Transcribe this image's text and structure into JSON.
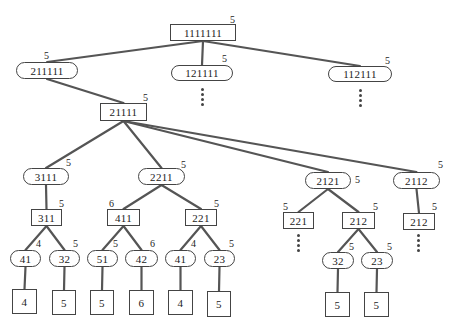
{
  "diagram": {
    "type": "tree",
    "edge_color": "#555555",
    "nodes": [
      {
        "id": "n0",
        "label": "1111111",
        "shape": "rect",
        "weight": "5",
        "x": 170,
        "y": 24,
        "w": 66,
        "h": 17,
        "wx": 230,
        "wy": 15
      },
      {
        "id": "n1",
        "label": "211111",
        "shape": "pill",
        "weight": "5",
        "x": 16,
        "y": 62,
        "w": 62,
        "h": 17,
        "wx": 44,
        "wy": 51
      },
      {
        "id": "n2",
        "label": "121111",
        "shape": "pill",
        "weight": "5",
        "x": 171,
        "y": 65,
        "w": 62,
        "h": 16,
        "wx": 222,
        "wy": 54
      },
      {
        "id": "n3",
        "label": "112111",
        "shape": "pill",
        "weight": "5",
        "x": 328,
        "y": 66,
        "w": 64,
        "h": 16,
        "wx": 385,
        "wy": 56
      },
      {
        "id": "n4",
        "label": "21111",
        "shape": "rect",
        "weight": "5",
        "x": 100,
        "y": 103,
        "w": 47,
        "h": 18,
        "wx": 143,
        "wy": 93
      },
      {
        "id": "n5",
        "label": "3111",
        "shape": "pill",
        "weight": "5",
        "x": 23,
        "y": 168,
        "w": 46,
        "h": 17,
        "wx": 66,
        "wy": 158
      },
      {
        "id": "n6",
        "label": "2211",
        "shape": "pill",
        "weight": "5",
        "x": 138,
        "y": 168,
        "w": 47,
        "h": 17,
        "wx": 181,
        "wy": 160
      },
      {
        "id": "n7",
        "label": "2121",
        "shape": "pill",
        "weight": "5",
        "x": 305,
        "y": 172,
        "w": 46,
        "h": 17,
        "wx": 355,
        "wy": 175
      },
      {
        "id": "n8",
        "label": "2112",
        "shape": "pill",
        "weight": "5",
        "x": 393,
        "y": 172,
        "w": 47,
        "h": 17,
        "wx": 438,
        "wy": 160
      },
      {
        "id": "n9",
        "label": "311",
        "shape": "rect",
        "weight": "5",
        "x": 31,
        "y": 209,
        "w": 31,
        "h": 17,
        "wx": 59,
        "wy": 199
      },
      {
        "id": "n10",
        "label": "411",
        "shape": "rect",
        "weight": "6",
        "x": 107,
        "y": 209,
        "w": 33,
        "h": 17,
        "wx": 109,
        "wy": 199
      },
      {
        "id": "n11",
        "label": "221",
        "shape": "rect",
        "weight": "5",
        "x": 185,
        "y": 209,
        "w": 32,
        "h": 17,
        "wx": 214,
        "wy": 199
      },
      {
        "id": "n12",
        "label": "221",
        "shape": "rect",
        "weight": "5",
        "x": 283,
        "y": 212,
        "w": 31,
        "h": 17,
        "wx": 283,
        "wy": 202
      },
      {
        "id": "n13",
        "label": "212",
        "shape": "rect",
        "weight": "5",
        "x": 342,
        "y": 212,
        "w": 33,
        "h": 17,
        "wx": 373,
        "wy": 202
      },
      {
        "id": "n14",
        "label": "212",
        "shape": "rect",
        "weight": "5",
        "x": 403,
        "y": 213,
        "w": 32,
        "h": 17,
        "wx": 432,
        "wy": 202
      },
      {
        "id": "n15",
        "label": "41",
        "shape": "pill",
        "weight": "4",
        "x": 10,
        "y": 250,
        "w": 31,
        "h": 17,
        "wx": 36,
        "wy": 239
      },
      {
        "id": "n16",
        "label": "32",
        "shape": "pill",
        "weight": "5",
        "x": 49,
        "y": 250,
        "w": 31,
        "h": 17,
        "wx": 73,
        "wy": 239
      },
      {
        "id": "n17",
        "label": "51",
        "shape": "pill",
        "weight": "5",
        "x": 87,
        "y": 250,
        "w": 31,
        "h": 17,
        "wx": 113,
        "wy": 239
      },
      {
        "id": "n18",
        "label": "42",
        "shape": "pill",
        "weight": "6",
        "x": 125,
        "y": 250,
        "w": 33,
        "h": 17,
        "wx": 150,
        "wy": 239
      },
      {
        "id": "n19",
        "label": "41",
        "shape": "pill",
        "weight": "4",
        "x": 165,
        "y": 250,
        "w": 31,
        "h": 17,
        "wx": 191,
        "wy": 239
      },
      {
        "id": "n20",
        "label": "23",
        "shape": "pill",
        "weight": "5",
        "x": 204,
        "y": 250,
        "w": 31,
        "h": 17,
        "wx": 229,
        "wy": 239
      },
      {
        "id": "n21",
        "label": "32",
        "shape": "pill",
        "weight": "5",
        "x": 322,
        "y": 252,
        "w": 32,
        "h": 17,
        "wx": 349,
        "wy": 242
      },
      {
        "id": "n22",
        "label": "23",
        "shape": "pill",
        "weight": "5",
        "x": 361,
        "y": 252,
        "w": 32,
        "h": 17,
        "wx": 387,
        "wy": 242
      },
      {
        "id": "n23",
        "label": "4",
        "shape": "leaf",
        "x": 12,
        "y": 289,
        "w": 25,
        "h": 25
      },
      {
        "id": "n24",
        "label": "5",
        "shape": "leaf",
        "x": 52,
        "y": 290,
        "w": 24,
        "h": 25
      },
      {
        "id": "n25",
        "label": "5",
        "shape": "leaf",
        "x": 90,
        "y": 290,
        "w": 24,
        "h": 25
      },
      {
        "id": "n26",
        "label": "6",
        "shape": "leaf",
        "x": 129,
        "y": 290,
        "w": 25,
        "h": 25
      },
      {
        "id": "n27",
        "label": "4",
        "shape": "leaf",
        "x": 168,
        "y": 290,
        "w": 25,
        "h": 25
      },
      {
        "id": "n28",
        "label": "5",
        "shape": "leaf",
        "x": 207,
        "y": 291,
        "w": 24,
        "h": 26
      },
      {
        "id": "n29",
        "label": "5",
        "shape": "leaf",
        "x": 325,
        "y": 292,
        "w": 25,
        "h": 25
      },
      {
        "id": "n30",
        "label": "5",
        "shape": "leaf",
        "x": 364,
        "y": 292,
        "w": 25,
        "h": 25
      }
    ],
    "edges": [
      [
        "n0",
        "n1"
      ],
      [
        "n0",
        "n2"
      ],
      [
        "n0",
        "n3"
      ],
      [
        "n1",
        "n4"
      ],
      [
        "n4",
        "n5"
      ],
      [
        "n4",
        "n6"
      ],
      [
        "n4",
        "n7"
      ],
      [
        "n4",
        "n8"
      ],
      [
        "n5",
        "n9"
      ],
      [
        "n6",
        "n10"
      ],
      [
        "n6",
        "n11"
      ],
      [
        "n7",
        "n12"
      ],
      [
        "n7",
        "n13"
      ],
      [
        "n8",
        "n14"
      ],
      [
        "n9",
        "n15"
      ],
      [
        "n9",
        "n16"
      ],
      [
        "n10",
        "n17"
      ],
      [
        "n10",
        "n18"
      ],
      [
        "n11",
        "n19"
      ],
      [
        "n11",
        "n20"
      ],
      [
        "n13",
        "n21"
      ],
      [
        "n13",
        "n22"
      ],
      [
        "n15",
        "n23"
      ],
      [
        "n16",
        "n24"
      ],
      [
        "n17",
        "n25"
      ],
      [
        "n18",
        "n26"
      ],
      [
        "n19",
        "n27"
      ],
      [
        "n20",
        "n28"
      ],
      [
        "n21",
        "n29"
      ],
      [
        "n22",
        "n30"
      ]
    ],
    "continuation_markers": [
      {
        "below": "121111",
        "x": 201,
        "y": 88
      },
      {
        "below": "112111",
        "x": 359,
        "y": 89
      },
      {
        "below": "221",
        "x": 297,
        "y": 234
      },
      {
        "below": "212",
        "x": 417,
        "y": 234
      }
    ]
  }
}
